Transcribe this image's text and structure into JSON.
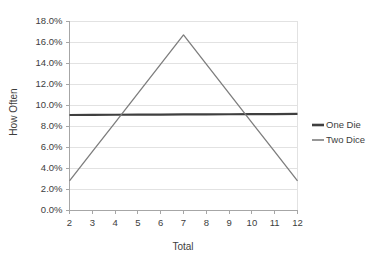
{
  "chart_data": {
    "type": "line",
    "title": "",
    "xlabel": "Total",
    "ylabel": "How Often",
    "x": [
      2,
      3,
      4,
      5,
      6,
      7,
      8,
      9,
      10,
      11,
      12
    ],
    "xlim": [
      2,
      12
    ],
    "ylim": [
      0.0,
      18.0
    ],
    "y_tick_labels": [
      "0.0%",
      "2.0%",
      "4.0%",
      "6.0%",
      "8.0%",
      "10.0%",
      "12.0%",
      "14.0%",
      "16.0%",
      "18.0%"
    ],
    "y_tick_values": [
      0.0,
      2.0,
      4.0,
      6.0,
      8.0,
      10.0,
      12.0,
      14.0,
      16.0,
      18.0
    ],
    "x_tick_labels": [
      "2",
      "3",
      "4",
      "5",
      "6",
      "7",
      "8",
      "9",
      "10",
      "11",
      "12"
    ],
    "grid": "horizontal",
    "legend_position": "right",
    "series": [
      {
        "name": "One Die",
        "color": "#3f3f3f",
        "width": 2.2,
        "values": [
          9.05,
          9.06,
          9.07,
          9.08,
          9.09,
          9.1,
          9.11,
          9.12,
          9.13,
          9.14,
          9.15
        ]
      },
      {
        "name": "Two Dice",
        "color": "#7d7d7d",
        "width": 1.3,
        "values": [
          2.78,
          5.56,
          8.33,
          11.11,
          13.89,
          16.67,
          13.89,
          11.11,
          8.33,
          5.56,
          2.78
        ]
      }
    ]
  },
  "axes": {
    "y_title": "How Often",
    "x_title": "Total"
  },
  "legend": {
    "items": [
      {
        "label": "One Die",
        "color": "#3f3f3f",
        "thickness": "thick"
      },
      {
        "label": "Two Dice",
        "color": "#7d7d7d",
        "thickness": "thin"
      }
    ]
  },
  "colors": {
    "axis": "#a6a6a6",
    "grid": "#e2e2e2",
    "text": "#3d3d3d",
    "background": "#ffffff"
  }
}
